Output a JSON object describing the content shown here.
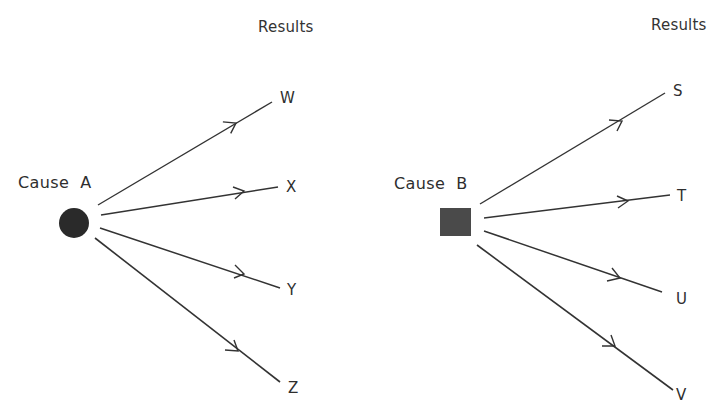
{
  "diagram": {
    "colors": {
      "ink": "#2e2e2e",
      "node_fill": "#2a2a2a",
      "square_fill": "#4a4a4a",
      "background": "#ffffff"
    },
    "left": {
      "results_heading": "Results",
      "cause_label": "Cause",
      "cause_letter": "A",
      "cause_shape": "circle",
      "results": [
        "W",
        "X",
        "Y",
        "Z"
      ]
    },
    "right": {
      "results_heading": "Results",
      "cause_label": "Cause",
      "cause_letter": "B",
      "cause_shape": "square",
      "results": [
        "S",
        "T",
        "U",
        "V"
      ]
    }
  }
}
